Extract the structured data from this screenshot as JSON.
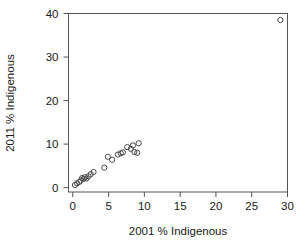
{
  "chart_data": {
    "type": "scatter",
    "title": "",
    "xlabel": "2001 % Indigenous",
    "ylabel": "2011 % Indigenous",
    "xlim": [
      -0.6,
      30.0
    ],
    "ylim": [
      -1.0,
      40.0
    ],
    "xticks": [
      0,
      5,
      10,
      15,
      20,
      25,
      30
    ],
    "yticks": [
      0,
      10,
      20,
      30,
      40
    ],
    "xticklabels": [
      "0",
      "5",
      "10",
      "15",
      "20",
      "25",
      "30"
    ],
    "yticklabels": [
      "0",
      "10",
      "20",
      "30",
      "40"
    ],
    "grid": false,
    "legend": null,
    "marker": "open-circle",
    "marker_color": "#4a4a4a",
    "points": [
      {
        "x": 0.3,
        "y": 0.6
      },
      {
        "x": 0.6,
        "y": 1.0
      },
      {
        "x": 0.9,
        "y": 1.3
      },
      {
        "x": 1.1,
        "y": 1.6
      },
      {
        "x": 1.3,
        "y": 2.2
      },
      {
        "x": 1.5,
        "y": 2.0
      },
      {
        "x": 1.7,
        "y": 2.4
      },
      {
        "x": 1.9,
        "y": 2.1
      },
      {
        "x": 2.2,
        "y": 2.6
      },
      {
        "x": 2.5,
        "y": 3.1
      },
      {
        "x": 2.9,
        "y": 3.6
      },
      {
        "x": 4.4,
        "y": 4.6
      },
      {
        "x": 4.9,
        "y": 7.1
      },
      {
        "x": 5.5,
        "y": 6.4
      },
      {
        "x": 6.3,
        "y": 7.6
      },
      {
        "x": 6.7,
        "y": 7.9
      },
      {
        "x": 7.0,
        "y": 8.1
      },
      {
        "x": 7.6,
        "y": 9.3
      },
      {
        "x": 8.1,
        "y": 8.9
      },
      {
        "x": 8.4,
        "y": 9.7
      },
      {
        "x": 8.6,
        "y": 8.2
      },
      {
        "x": 9.0,
        "y": 8.0
      },
      {
        "x": 9.2,
        "y": 10.2
      },
      {
        "x": 29.0,
        "y": 38.5
      }
    ]
  },
  "axes": {
    "x_axis_name": "2001 % Indigenous",
    "y_axis_name": "2011 % Indigenous"
  }
}
